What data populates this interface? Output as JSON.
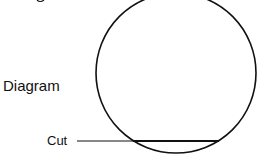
{
  "diagram": {
    "title_label": "Diagram",
    "cut_label": "Cut",
    "colors": {
      "stroke": "#111111",
      "background": "#ffffff"
    },
    "shapes": {
      "circle": {
        "cx": 176,
        "cy": 73,
        "r": 80
      },
      "cut_line": {
        "y": 141,
        "x_start": 77,
        "chord_start": 133,
        "chord_end": 219
      }
    }
  }
}
